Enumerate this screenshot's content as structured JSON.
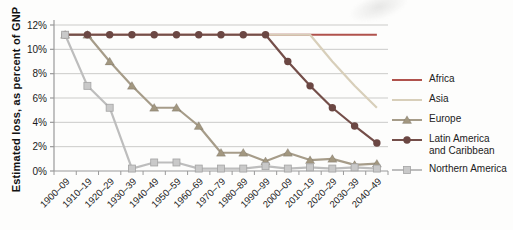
{
  "figure": {
    "background": "#fdfdfc",
    "text_color": "#1b1b1b",
    "gridline_color": "#cbcbc9",
    "axis_color": "#9a9a9a"
  },
  "chart_data": {
    "type": "line",
    "title": "",
    "xlabel": "",
    "ylabel": "Estimated loss, as percent of GNP",
    "ylim": [
      0,
      12
    ],
    "yticks": [
      0,
      2,
      4,
      6,
      8,
      10,
      12
    ],
    "ytick_labels": [
      "0%",
      "2%",
      "4%",
      "6%",
      "8%",
      "10%",
      "12%"
    ],
    "grid": "horizontal",
    "legend_position": "right",
    "categories": [
      "1900–09",
      "1910–19",
      "1920–29",
      "1930–39",
      "1940–49",
      "1950–59",
      "1960–69",
      "1970–79",
      "1980–89",
      "1990–99",
      "2000–09",
      "2010–19",
      "2020–29",
      "2030–39",
      "2040–49"
    ],
    "series": [
      {
        "name": "Africa",
        "label_lines": [
          "Africa"
        ],
        "color": "#b0524c",
        "marker": "none",
        "values": [
          11.2,
          11.2,
          11.2,
          11.2,
          11.2,
          11.2,
          11.2,
          11.2,
          11.2,
          11.2,
          11.2,
          11.2,
          11.2,
          11.2,
          11.2
        ]
      },
      {
        "name": "Asia",
        "label_lines": [
          "Asia"
        ],
        "color": "#d8cfba",
        "marker": "none",
        "values": [
          11.2,
          11.2,
          11.2,
          11.2,
          11.2,
          11.2,
          11.2,
          11.2,
          11.2,
          11.2,
          11.2,
          11.2,
          9.0,
          7.0,
          5.2
        ]
      },
      {
        "name": "Europe",
        "label_lines": [
          "Europe"
        ],
        "color": "#a69c89",
        "marker": "triangle",
        "marker_color": "#a29780",
        "values": [
          11.2,
          11.2,
          9.0,
          7.0,
          5.2,
          5.2,
          3.7,
          1.5,
          1.5,
          0.8,
          1.5,
          0.9,
          1.0,
          0.5,
          0.6
        ]
      },
      {
        "name": "Latin America and Caribbean",
        "label_lines": [
          "Latin America",
          "and Caribbean"
        ],
        "color": "#744e49",
        "marker": "circle",
        "marker_color": "#6b4743",
        "values": [
          11.2,
          11.2,
          11.2,
          11.2,
          11.2,
          11.2,
          11.2,
          11.2,
          11.2,
          11.2,
          9.0,
          7.0,
          5.2,
          3.7,
          2.3
        ]
      },
      {
        "name": "Northern America",
        "label_lines": [
          "Northern America"
        ],
        "color": "#bdbdbd",
        "marker": "square",
        "marker_color": "#c9c9c9",
        "values": [
          11.2,
          7.0,
          5.2,
          0.2,
          0.7,
          0.7,
          0.2,
          0.2,
          0.2,
          0.4,
          0.2,
          0.3,
          0.2,
          0.3,
          0.2
        ]
      }
    ]
  }
}
